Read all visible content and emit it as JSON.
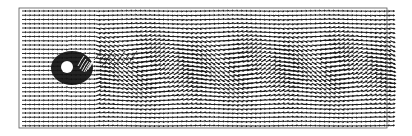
{
  "figure": {
    "type": "vector-field",
    "background": "#ffffff",
    "ink": "#1a1a1a",
    "frame": {
      "x": 19,
      "y": 8,
      "width": 368,
      "height": 120,
      "stroke": "#555555"
    },
    "grid": {
      "x0": 22,
      "x1": 392,
      "dx": 4.6,
      "y0": 11,
      "y1": 126,
      "dy": 4.25
    },
    "cylinder": {
      "cx": 67,
      "cy": 67,
      "r": 6,
      "fill": "#ffffff"
    },
    "near_wake": {
      "cx": 72,
      "cy": 68,
      "rx": 21,
      "ry": 17,
      "fill": "#111111"
    },
    "wake": {
      "start_x": 95,
      "end_x": 392,
      "wavelength": 95,
      "amplitude": 0.55,
      "half_width": 30,
      "center_y": 68
    },
    "arrow": {
      "length": 4.2,
      "head": 1.4,
      "stroke_width": 0.9
    }
  }
}
